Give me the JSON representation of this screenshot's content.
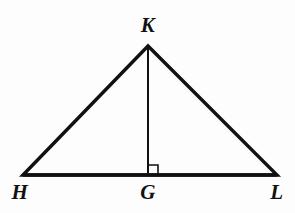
{
  "figure": {
    "kind": "geometry-diagram",
    "width": 295,
    "height": 213,
    "background_color": "#fdfdfd",
    "stroke_color": "#111111",
    "labels": [
      {
        "id": "K",
        "text": "K",
        "x": 148,
        "y": 25,
        "role": "apex-vertex-label"
      },
      {
        "id": "H",
        "text": "H",
        "x": 20,
        "y": 192,
        "role": "base-left-vertex-label"
      },
      {
        "id": "G",
        "text": "G",
        "x": 148,
        "y": 192,
        "role": "altitude-foot-label"
      },
      {
        "id": "L",
        "text": "L",
        "x": 277,
        "y": 192,
        "role": "base-right-vertex-label"
      }
    ],
    "points": {
      "K": {
        "x": 148,
        "y": 46
      },
      "H": {
        "x": 23,
        "y": 175
      },
      "G": {
        "x": 148,
        "y": 175
      },
      "L": {
        "x": 277,
        "y": 175
      }
    },
    "segments": [
      {
        "id": "HK",
        "from": "H",
        "to": "K",
        "stroke_width": 3.4,
        "style": "solid",
        "role": "triangle-left-side"
      },
      {
        "id": "KL",
        "from": "K",
        "to": "L",
        "stroke_width": 3.4,
        "style": "solid",
        "role": "triangle-right-side"
      },
      {
        "id": "HL",
        "from": "H",
        "to": "L",
        "stroke_width": 3.6,
        "style": "solid",
        "role": "triangle-base"
      },
      {
        "id": "KG",
        "from": "K",
        "to": "G",
        "stroke_width": 2.0,
        "style": "solid",
        "role": "altitude"
      }
    ],
    "right_angle_marker": {
      "at": "G",
      "size": 10,
      "side": "right",
      "stroke_width": 1.6,
      "path": "M 148 165 L 158 165 L 158 175"
    },
    "geometry_paths": {
      "triangle_outline": "M 23 175 L 148 46 L 277 175 Z",
      "altitude": "M 148 46 L 148 175"
    }
  }
}
